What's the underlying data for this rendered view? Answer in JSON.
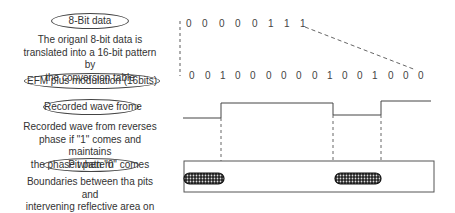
{
  "labels": {
    "eight_bit": "8-Bit data",
    "eight_bit_desc_1": "The origanl 8-bit data is",
    "eight_bit_desc_2": "translated into a 16-bit pattern by",
    "eight_bit_desc_3": "the conversion table",
    "efm": "EFM plus modulation (16bits)",
    "wave": "Recorded wave frome",
    "wave_desc_1": "Recorded wave from reverses",
    "wave_desc_2": "phase if \"1\" comes and maintains",
    "wave_desc_3": "the phase when \"0\" comes",
    "pit": "Pit pattern",
    "pit_desc_1": "Boundaries between tha pits and",
    "pit_desc_2": "intervening reflective area on the",
    "pit_desc_3": "disc, or pit edges, are \"1s\""
  },
  "bits": {
    "eight": [
      "0",
      "0",
      "0",
      "0",
      "0",
      "1",
      "1",
      "1"
    ],
    "sixteen": [
      "0",
      "0",
      "1",
      "0",
      "0",
      "0",
      "0",
      "0",
      "0",
      "1",
      "0",
      "0",
      "1",
      "0",
      "0",
      "0"
    ]
  },
  "colors": {
    "line": "#444444",
    "dash": "#666666",
    "pit": "#111111"
  }
}
